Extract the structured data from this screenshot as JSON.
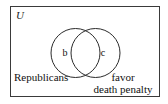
{
  "figure": {
    "type": "venn-diagram",
    "universe_label": "U",
    "background_color": "#ffffff",
    "stroke_color": "#3a3a3a",
    "text_color": "#111111",
    "sets": [
      {
        "id": "left-set",
        "caption": "Republicans",
        "region_letter": "b"
      },
      {
        "id": "right-set",
        "caption_line1": "favor",
        "caption_line2": "death penalty",
        "region_letter": "c"
      }
    ]
  }
}
